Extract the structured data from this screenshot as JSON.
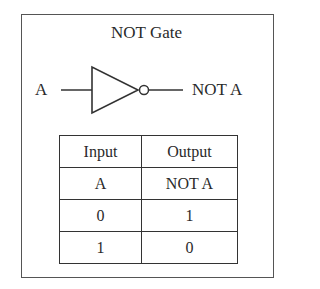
{
  "diagram": {
    "title": "NOT Gate",
    "gate": {
      "type": "NOT",
      "input_label": "A",
      "output_label": "NOT A"
    },
    "truth_table": {
      "headers": [
        "Input",
        "Output"
      ],
      "subheaders": [
        "A",
        "NOT A"
      ],
      "rows": [
        [
          "0",
          "1"
        ],
        [
          "1",
          "0"
        ]
      ]
    },
    "colors": {
      "line": "#333333",
      "text": "#2a2a2a",
      "background": "#ffffff"
    }
  }
}
